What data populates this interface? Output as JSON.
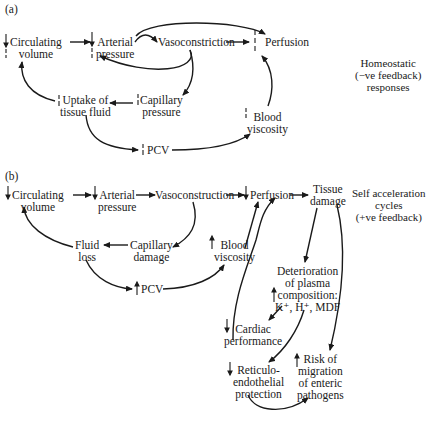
{
  "panel_a": {
    "tag": "(a)",
    "side_label": [
      "Homeostatic",
      "(−ve feedback)",
      "responses"
    ],
    "nodes": {
      "circulating_volume": [
        "Circulating",
        "volume"
      ],
      "arterial_pressure": [
        "Arterial",
        "pressure"
      ],
      "vasoconstriction": "Vasoconstriction",
      "perfusion": "Perfusion",
      "uptake_tissue_fluid": [
        "Uptake of",
        "tissue fluid"
      ],
      "capillary_pressure": [
        "Capillary",
        "pressure"
      ],
      "blood_viscosity": [
        "Blood",
        "viscosity"
      ],
      "pcv": "PCV"
    },
    "indicators": {
      "circulating_volume": "restored-up (dashed)",
      "arterial_pressure": "down + restored",
      "perfusion": "restored (dashed)",
      "uptake_tissue_fluid": "up (dashed)",
      "capillary_pressure": "down (dashed)",
      "blood_viscosity": "down (dashed)",
      "pcv": "down (dashed)"
    }
  },
  "panel_b": {
    "tag": "(b)",
    "side_label": [
      "Self acceleration",
      "cycles",
      "(+ve feedback)"
    ],
    "nodes": {
      "circulating_volume": [
        "Circulating",
        "volume"
      ],
      "arterial_pressure": [
        "Arterial",
        "pressure"
      ],
      "vasoconstruction": "Vasoconstruction",
      "perfusion": "Perfusion",
      "tissue_damage": [
        "Tissue",
        "damage"
      ],
      "fluid_loss": [
        "Fluid",
        "loss"
      ],
      "capillary_damage": [
        "Capillary",
        "damage"
      ],
      "blood_viscosity": [
        "Blood",
        "viscosity"
      ],
      "pcv": "PCV",
      "deterioration": [
        "Deterioration",
        "of plasma",
        "composition:",
        "K⁺, H⁺, MDF"
      ],
      "cardiac_performance": [
        "Cardiac",
        "performance"
      ],
      "reticuloendothelial": [
        "Reticulo-",
        "endothelial",
        "protection"
      ],
      "risk_migration": [
        "Risk of",
        "migration",
        "of enteric",
        "pathogens"
      ]
    },
    "indicators": {
      "circulating_volume": "down",
      "arterial_pressure": "down",
      "perfusion": "down",
      "blood_viscosity": "up",
      "pcv": "up",
      "deterioration": "up",
      "cardiac_performance": "down",
      "reticuloendothelial": "down",
      "risk_migration": "up"
    }
  }
}
